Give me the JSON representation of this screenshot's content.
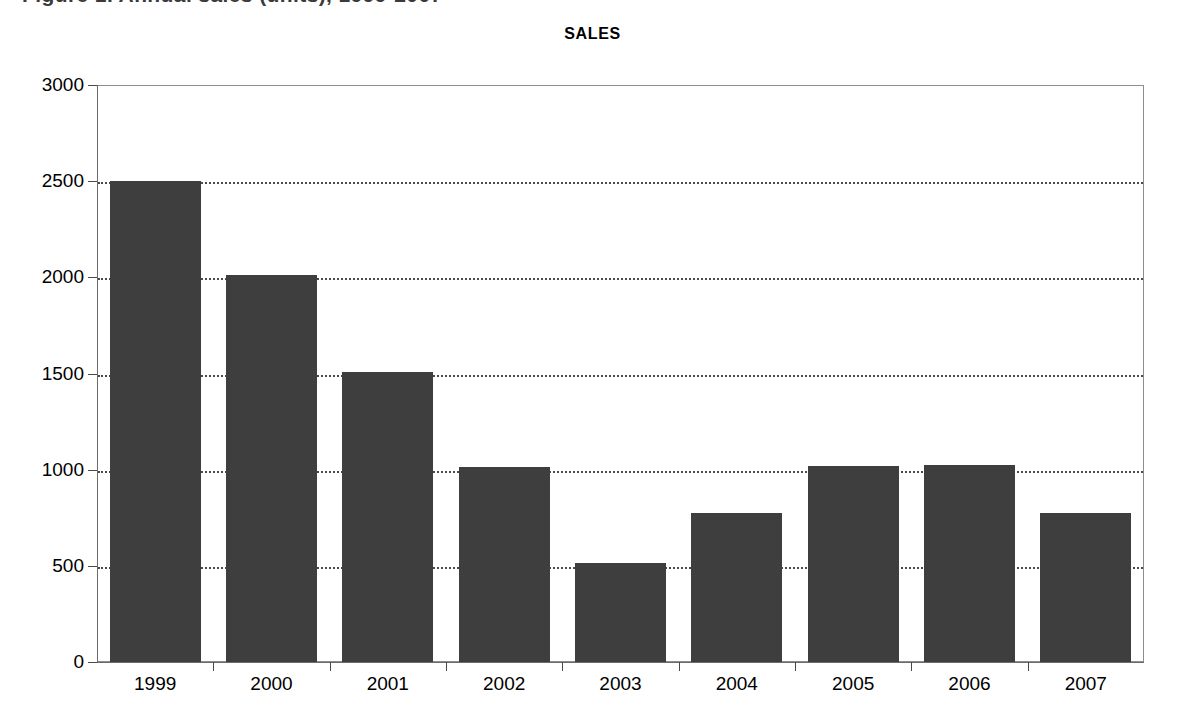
{
  "page": {
    "caption_strip_text": "Figure 1. Annual sales (units), 1999-2007",
    "background_color": "#ffffff"
  },
  "chart_data": {
    "type": "bar",
    "title": "SALES",
    "xlabel": "",
    "ylabel": "",
    "categories": [
      "1999",
      "2000",
      "2001",
      "2002",
      "2003",
      "2004",
      "2005",
      "2006",
      "2007"
    ],
    "values": [
      2500,
      2010,
      1510,
      1015,
      515,
      775,
      1020,
      1025,
      775
    ],
    "series": [
      {
        "name": "SALES",
        "values": [
          2500,
          2010,
          1510,
          1015,
          515,
          775,
          1020,
          1025,
          775
        ]
      }
    ],
    "ylim": [
      0,
      3000
    ],
    "ytick_values": [
      0,
      500,
      1000,
      1500,
      2000,
      2500,
      3000
    ],
    "ytick_labels": [
      "0",
      "500",
      "1000",
      "1500",
      "2000",
      "2500",
      "3000"
    ],
    "grid": true,
    "grid_style": "dotted",
    "grid_axis": "y",
    "legend": false,
    "legend_position": "none",
    "bar_color": "#3e3e3e",
    "frame_color": "#8d8d8d",
    "axis_color": "#6b6b6b",
    "grid_color": "#4a4a4a",
    "bar_width_ratio": 0.78
  }
}
